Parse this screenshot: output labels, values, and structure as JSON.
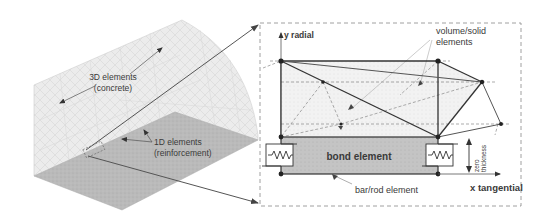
{
  "left_panel": {
    "label_3d_line1": "3D elements",
    "label_3d_line2": "(concrete)",
    "label_1d_line1": "1D elements",
    "label_1d_line2": "(reinforcement)"
  },
  "right_panel": {
    "y_axis_label": "y radial",
    "x_axis_label": "x tangential",
    "volume_label_line1": "volume/solid",
    "volume_label_line2": "elements",
    "bond_label": "bond element",
    "bar_label": "bar/rod element",
    "thickness_label_line1": "zero",
    "thickness_label_line2": "thickness"
  },
  "colors": {
    "mesh_light": "#e4e4e4",
    "mesh_floor": "#bdbdbd",
    "bond_fill": "#c2c2c2",
    "line_dark": "#333333",
    "line_mid": "#777777"
  }
}
